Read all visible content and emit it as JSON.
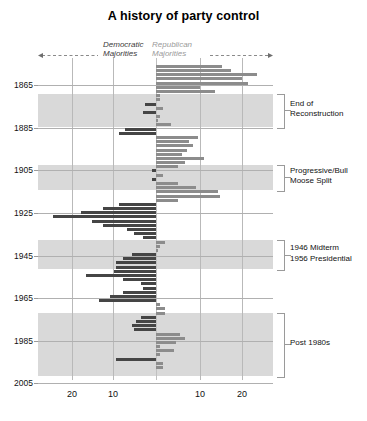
{
  "chart_data": {
    "type": "bar",
    "title": "A history of party control",
    "orientation": "horizontal-diverging",
    "xlabel": "",
    "ylabel": "",
    "xlim": [
      -26,
      26
    ],
    "x_tick_labels": [
      "20",
      "10",
      "10",
      "20"
    ],
    "x_tick_values": [
      -20,
      -10,
      10,
      20
    ],
    "y_tick_labels": [
      "1865",
      "1885",
      "1905",
      "1925",
      "1945",
      "1965",
      "1985",
      "2005"
    ],
    "y_tick_values": [
      1865,
      1885,
      1905,
      1925,
      1945,
      1965,
      1985,
      2005
    ],
    "ylim": [
      1857,
      2011
    ],
    "grid": true,
    "legend_position": "top-inline",
    "series": [
      {
        "name": "Democratic Majorities",
        "color": "#454545",
        "direction": "left"
      },
      {
        "name": "Republican Majorities",
        "color": "#8c8c8c",
        "direction": "right"
      }
    ],
    "bars": [
      {
        "year": 1861,
        "value": 15.0,
        "party": "Republican"
      },
      {
        "year": 1863,
        "value": 17.0,
        "party": "Republican"
      },
      {
        "year": 1865,
        "value": 23.0,
        "party": "Republican"
      },
      {
        "year": 1867,
        "value": 19.5,
        "party": "Republican"
      },
      {
        "year": 1869,
        "value": 21.0,
        "party": "Republican"
      },
      {
        "year": 1871,
        "value": 10.0,
        "party": "Republican"
      },
      {
        "year": 1873,
        "value": 13.5,
        "party": "Republican"
      },
      {
        "year": 1875,
        "value": 1.0,
        "party": "Republican"
      },
      {
        "year": 1877,
        "value": 1.0,
        "party": "Republican"
      },
      {
        "year": 1879,
        "value": 2.5,
        "party": "Democratic"
      },
      {
        "year": 1881,
        "value": 1.5,
        "party": "Republican"
      },
      {
        "year": 1883,
        "value": 3.0,
        "party": "Democratic"
      },
      {
        "year": 1885,
        "value": 0.8,
        "party": "Republican"
      },
      {
        "year": 1887,
        "value": 0.5,
        "party": "Republican"
      },
      {
        "year": 1889,
        "value": 3.5,
        "party": "Republican"
      },
      {
        "year": 1891,
        "value": 7.0,
        "party": "Democratic"
      },
      {
        "year": 1893,
        "value": 8.5,
        "party": "Democratic"
      },
      {
        "year": 1895,
        "value": 9.5,
        "party": "Republican"
      },
      {
        "year": 1897,
        "value": 7.5,
        "party": "Republican"
      },
      {
        "year": 1899,
        "value": 8.5,
        "party": "Republican"
      },
      {
        "year": 1901,
        "value": 7.0,
        "party": "Republican"
      },
      {
        "year": 1903,
        "value": 6.0,
        "party": "Republican"
      },
      {
        "year": 1905,
        "value": 11.0,
        "party": "Republican"
      },
      {
        "year": 1907,
        "value": 6.5,
        "party": "Republican"
      },
      {
        "year": 1909,
        "value": 5.0,
        "party": "Republican"
      },
      {
        "year": 1911,
        "value": 1.0,
        "party": "Democratic"
      },
      {
        "year": 1913,
        "value": 1.5,
        "party": "Republican"
      },
      {
        "year": 1915,
        "value": 0.8,
        "party": "Democratic"
      },
      {
        "year": 1917,
        "value": 5.0,
        "party": "Republican"
      },
      {
        "year": 1919,
        "value": 9.0,
        "party": "Republican"
      },
      {
        "year": 1921,
        "value": 14.0,
        "party": "Republican"
      },
      {
        "year": 1923,
        "value": 14.5,
        "party": "Republican"
      },
      {
        "year": 1925,
        "value": 5.0,
        "party": "Republican"
      },
      {
        "year": 1927,
        "value": 8.5,
        "party": "Democratic"
      },
      {
        "year": 1929,
        "value": 12.0,
        "party": "Democratic"
      },
      {
        "year": 1931,
        "value": 17.0,
        "party": "Democratic"
      },
      {
        "year": 1933,
        "value": 23.5,
        "party": "Democratic"
      },
      {
        "year": 1935,
        "value": 14.5,
        "party": "Democratic"
      },
      {
        "year": 1937,
        "value": 12.0,
        "party": "Democratic"
      },
      {
        "year": 1939,
        "value": 6.5,
        "party": "Democratic"
      },
      {
        "year": 1941,
        "value": 5.0,
        "party": "Democratic"
      },
      {
        "year": 1943,
        "value": 3.0,
        "party": "Democratic"
      },
      {
        "year": 1945,
        "value": 2.0,
        "party": "Republican"
      },
      {
        "year": 1947,
        "value": 1.0,
        "party": "Republican"
      },
      {
        "year": 1949,
        "value": 0.5,
        "party": "Republican"
      },
      {
        "year": 1951,
        "value": 5.5,
        "party": "Democratic"
      },
      {
        "year": 1953,
        "value": 7.5,
        "party": "Democratic"
      },
      {
        "year": 1955,
        "value": 9.0,
        "party": "Democratic"
      },
      {
        "year": 1957,
        "value": 9.0,
        "party": "Democratic"
      },
      {
        "year": 1959,
        "value": 9.5,
        "party": "Democratic"
      },
      {
        "year": 1961,
        "value": 16.0,
        "party": "Democratic"
      },
      {
        "year": 1963,
        "value": 7.5,
        "party": "Democratic"
      },
      {
        "year": 1965,
        "value": 3.5,
        "party": "Democratic"
      },
      {
        "year": 1967,
        "value": 3.0,
        "party": "Democratic"
      },
      {
        "year": 1969,
        "value": 7.5,
        "party": "Democratic"
      },
      {
        "year": 1971,
        "value": 10.5,
        "party": "Democratic"
      },
      {
        "year": 1973,
        "value": 13.0,
        "party": "Democratic"
      },
      {
        "year": 1975,
        "value": 1.0,
        "party": "Republican"
      },
      {
        "year": 1977,
        "value": 2.0,
        "party": "Republican"
      },
      {
        "year": 1979,
        "value": 2.0,
        "party": "Republican"
      },
      {
        "year": 1981,
        "value": 3.5,
        "party": "Democratic"
      },
      {
        "year": 1983,
        "value": 4.5,
        "party": "Democratic"
      },
      {
        "year": 1985,
        "value": 5.5,
        "party": "Democratic"
      },
      {
        "year": 1987,
        "value": 5.0,
        "party": "Democratic"
      },
      {
        "year": 1989,
        "value": 5.5,
        "party": "Republican"
      },
      {
        "year": 1991,
        "value": 6.5,
        "party": "Republican"
      },
      {
        "year": 1993,
        "value": 4.5,
        "party": "Republican"
      },
      {
        "year": 1995,
        "value": 1.0,
        "party": "Republican"
      },
      {
        "year": 1997,
        "value": 4.0,
        "party": "Republican"
      },
      {
        "year": 1999,
        "value": 1.0,
        "party": "Republican"
      },
      {
        "year": 2001,
        "value": 9.0,
        "party": "Democratic"
      },
      {
        "year": 2003,
        "value": 1.5,
        "party": "Republican"
      },
      {
        "year": 2005,
        "value": 1.5,
        "party": "Republican"
      }
    ],
    "shaded_bands": [
      {
        "label": "End of Reconstruction",
        "start_year": 1874,
        "end_year": 1890
      },
      {
        "label": "Progressive/Bull Moose Split",
        "start_year": 1908,
        "end_year": 1920
      },
      {
        "label": "1946 Midterm / 1956 Presidential",
        "start_year": 1944,
        "end_year": 1958
      },
      {
        "label": "Post 1980s",
        "start_year": 1979,
        "end_year": 2009
      }
    ],
    "annotations": [
      {
        "id": "a1",
        "lines": [
          "End of",
          "Reconstruction"
        ]
      },
      {
        "id": "a2",
        "lines": [
          "Progressive/Bull",
          "Moose Split"
        ]
      },
      {
        "id": "a3",
        "lines": [
          "1946 Midterm",
          "1956 Presidential"
        ]
      },
      {
        "id": "a4",
        "lines": [
          "Post 1980s"
        ]
      }
    ]
  },
  "header": {
    "title": "A history of party control",
    "dem_label_line1": "Democratic",
    "dem_label_line2": "Majorities",
    "rep_label_line1": "Republican",
    "rep_label_line2": "Majorities"
  },
  "axes": {
    "x_ticks": [
      {
        "label": "20",
        "px": 72
      },
      {
        "label": "10",
        "px": 113
      },
      {
        "label": "10",
        "px": 200
      },
      {
        "label": "20",
        "px": 242
      }
    ],
    "y_ticks": [
      {
        "label": "1865",
        "px": 27
      },
      {
        "label": "1885",
        "px": 70
      },
      {
        "label": "1905",
        "px": 112
      },
      {
        "label": "1925",
        "px": 155
      },
      {
        "label": "1945",
        "px": 198
      },
      {
        "label": "1965",
        "px": 240
      },
      {
        "label": "1985",
        "px": 283
      },
      {
        "label": "2005",
        "px": 325
      }
    ]
  },
  "annotations": {
    "a1_line1": "End of",
    "a1_line2": "Reconstruction",
    "a2_line1": "Progressive/Bull",
    "a2_line2": "Moose Split",
    "a3_line1": "1946 Midterm",
    "a3_line2": "1956 Presidential",
    "a4_line1": "Post 1980s"
  },
  "colors": {
    "democratic": "#454545",
    "republican": "#8c8c8c",
    "band": "#d9d9d9",
    "grid": "#b0b0b0",
    "background": "#ffffff"
  }
}
